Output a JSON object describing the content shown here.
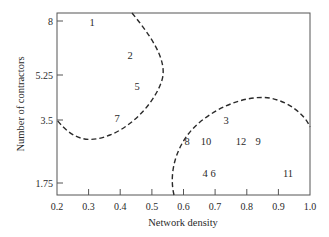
{
  "chart_data": {
    "type": "scatter",
    "title": "",
    "xlabel": "Network density",
    "ylabel": "Number of contractors",
    "xlim": [
      0.2,
      1.0
    ],
    "ylim": [
      1.25,
      8.2
    ],
    "x_ticks": [
      "0.2",
      "0.3",
      "0.4",
      "0.5",
      "0.6",
      "0.7",
      "0.8",
      "0.9",
      "1.0"
    ],
    "y_ticks": [
      "8",
      "5.25",
      "3.5",
      "1.75"
    ],
    "grid": false,
    "legend": null,
    "points": [
      {
        "label": "1",
        "x": 0.31,
        "y": 8.0
      },
      {
        "label": "2",
        "x": 0.43,
        "y": 6.4
      },
      {
        "label": "5",
        "x": 0.45,
        "y": 5.0
      },
      {
        "label": "7",
        "x": 0.39,
        "y": 3.55
      },
      {
        "label": "3",
        "x": 0.73,
        "y": 3.45
      },
      {
        "label": "8",
        "x": 0.61,
        "y": 2.85
      },
      {
        "label": "10",
        "x": 0.67,
        "y": 2.85
      },
      {
        "label": "12",
        "x": 0.88,
        "y": 2.85
      },
      {
        "label": "9",
        "x": 0.94,
        "y": 2.85
      },
      {
        "label": "4",
        "x": 0.68,
        "y": 2.0
      },
      {
        "label": "6",
        "x": 0.71,
        "y": 2.0
      },
      {
        "label": "11",
        "x": 0.93,
        "y": 2.0
      }
    ],
    "annotations": [
      {
        "type": "dashed-boundary",
        "description": "Cluster boundary enclosing points 1, 2, 5, 7 (upper-left)"
      },
      {
        "type": "dashed-boundary",
        "description": "Cluster boundary enclosing points 3, 4, 6, 8, 9, 10, 11, 12 (lower-right)"
      }
    ]
  },
  "layout": {
    "plot": {
      "left": 57,
      "top": 13,
      "right": 310,
      "bottom": 195
    },
    "x_tick_px": [
      57,
      88.6,
      120.2,
      151.9,
      183.5,
      215.1,
      246.8,
      278.4,
      310
    ],
    "y_tick_px": [
      21,
      75,
      120,
      183
    ],
    "point_px": [
      [
        92,
        22
      ],
      [
        130,
        55
      ],
      [
        137,
        86
      ],
      [
        117,
        118
      ],
      [
        226,
        120
      ],
      [
        187,
        141
      ],
      [
        206,
        141
      ],
      [
        241,
        141
      ],
      [
        258,
        141
      ],
      [
        205,
        173
      ],
      [
        213,
        173
      ],
      [
        288,
        173
      ]
    ]
  },
  "colors": {
    "axis": "#555555",
    "text": "#2a2a2a",
    "boundary": "#2a2a2a",
    "background": "#ffffff"
  }
}
